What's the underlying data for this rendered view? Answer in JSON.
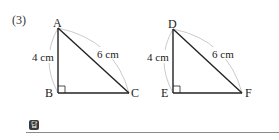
{
  "problem": {
    "number": "(3)"
  },
  "triangles": [
    {
      "name": "triangle-ABC",
      "vertices": {
        "A": {
          "label": "A",
          "x": 58,
          "y": 28
        },
        "B": {
          "label": "B",
          "x": 58,
          "y": 93
        },
        "C": {
          "label": "C",
          "x": 129,
          "y": 93
        }
      },
      "right_angle_at": "B",
      "side_labels": {
        "AB": "4 cm",
        "AC": "6 cm"
      }
    },
    {
      "name": "triangle-DEF",
      "vertices": {
        "D": {
          "label": "D",
          "x": 173,
          "y": 29
        },
        "E": {
          "label": "E",
          "x": 173,
          "y": 93
        },
        "F": {
          "label": "F",
          "x": 242,
          "y": 93
        }
      },
      "right_angle_at": "E",
      "side_labels": {
        "DE": "4 cm",
        "DF": "6 cm"
      }
    }
  ],
  "answer": {
    "badge": "답",
    "value": ""
  }
}
